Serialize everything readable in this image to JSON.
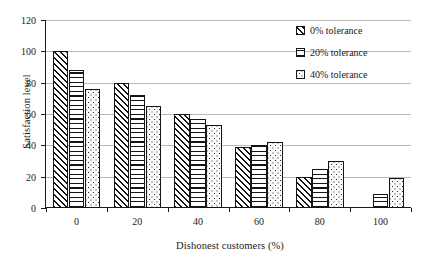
{
  "chart_data": {
    "type": "bar",
    "title": "",
    "xlabel": "Dishonest customers (%)",
    "ylabel": "Satisfaction level",
    "categories": [
      "0",
      "20",
      "40",
      "60",
      "80",
      "100"
    ],
    "series": [
      {
        "name": "0% tolerance",
        "values": [
          100,
          80,
          60,
          39,
          20,
          0
        ],
        "pattern": "diagonal-hatch"
      },
      {
        "name": "20% tolerance",
        "values": [
          88,
          72,
          57,
          40,
          25,
          9
        ],
        "pattern": "horizontal-lines"
      },
      {
        "name": "40% tolerance",
        "values": [
          76,
          65,
          53,
          42,
          30,
          19
        ],
        "pattern": "dotted"
      }
    ],
    "ylim": [
      0,
      120
    ],
    "yticks": [
      0,
      20,
      40,
      60,
      80,
      100,
      120
    ],
    "ytick_labels": [
      "0",
      "20",
      "40",
      "60",
      "80",
      "100",
      "120"
    ],
    "xtick_labels": [
      "0",
      "20",
      "40",
      "60",
      "80",
      "100"
    ],
    "grid": true,
    "grid_axis": "y",
    "legend_position": "top-right",
    "colors": {
      "bar_edge": "#151515",
      "gridline": "#b9b9b9",
      "axis": "#1a1a1a",
      "background": "#ffffff"
    }
  },
  "legend": {
    "items": [
      {
        "label": "0% tolerance"
      },
      {
        "label": "20% tolerance"
      },
      {
        "label": "40% tolerance"
      }
    ]
  }
}
